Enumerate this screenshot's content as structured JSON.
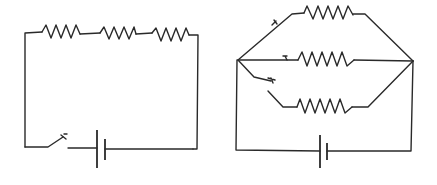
{
  "figure": {
    "colors": {
      "background": "#ffffff",
      "line": "#2a2a2a"
    }
  },
  "series_circuit": {
    "label": "Series circuit",
    "resistors": [
      {
        "id": "R1",
        "label": "Resistor 1"
      },
      {
        "id": "R2",
        "label": "Resistor 2"
      },
      {
        "id": "R3",
        "label": "Resistor 3"
      }
    ],
    "switch": {
      "label": "Switch",
      "state": "open"
    },
    "battery": {
      "label": "Battery"
    }
  },
  "parallel_circuit": {
    "label": "Parallel circuit",
    "branches": [
      {
        "position": "top",
        "resistor_label": "Resistor top branch",
        "switch_state": "closed"
      },
      {
        "position": "middle",
        "resistor_label": "Resistor middle branch",
        "switch_state": "closed"
      },
      {
        "position": "bottom",
        "resistor_label": "Resistor bottom branch",
        "switch_state": "open"
      }
    ],
    "battery": {
      "label": "Battery"
    }
  }
}
